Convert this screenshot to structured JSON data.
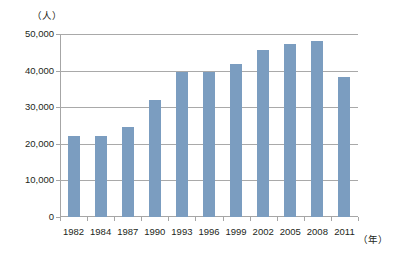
{
  "chart_data": {
    "type": "bar",
    "title": "",
    "subtitle": "",
    "xlabel": "（年）",
    "ylabel": "（人）",
    "categories": [
      "1982",
      "1984",
      "1987",
      "1990",
      "1993",
      "1996",
      "1999",
      "2002",
      "2005",
      "2008",
      "2011"
    ],
    "values": [
      22000,
      22200,
      24700,
      32000,
      39500,
      39500,
      41800,
      45500,
      47400,
      48200,
      38300
    ],
    "ylim": [
      0,
      50000
    ],
    "ytick_values": [
      0,
      10000,
      20000,
      30000,
      40000,
      50000
    ],
    "ytick_labels": [
      "0",
      "10,000",
      "20,000",
      "30,000",
      "40,000",
      "50,000"
    ],
    "grid": true,
    "grid_axis": "y",
    "legend": false,
    "legend_position": "none",
    "series": [
      {
        "name": "人数",
        "color": "#7b9dc0",
        "values": [
          22000,
          22200,
          24700,
          32000,
          39500,
          39500,
          41800,
          45500,
          47400,
          48200,
          38300
        ]
      }
    ]
  },
  "axes": {
    "y_unit_label": "（人）",
    "x_unit_label": "（年）"
  },
  "colors": {
    "bar": "#7b9dc0",
    "gridline": "#a9a9a9",
    "axis": "#a6a6a6",
    "text": "#231f20",
    "background": "#ffffff"
  }
}
